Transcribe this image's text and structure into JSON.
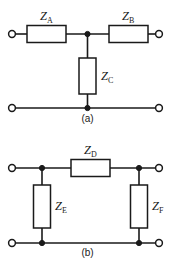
{
  "figure": {
    "background_color": "#ffffff",
    "line_color": "#1a1a1a"
  },
  "circuits": [
    {
      "id": "a",
      "caption": "(a)",
      "topology": "tee-network",
      "components": [
        {
          "id": "ZA",
          "symbol": "Z",
          "subscript": "A",
          "label": "Z_A",
          "orientation": "horizontal",
          "branch": "series-left"
        },
        {
          "id": "ZB",
          "symbol": "Z",
          "subscript": "B",
          "label": "Z_B",
          "orientation": "horizontal",
          "branch": "series-right"
        },
        {
          "id": "ZC",
          "symbol": "Z",
          "subscript": "C",
          "label": "Z_C",
          "orientation": "vertical",
          "branch": "shunt-middle"
        }
      ],
      "terminals": [
        {
          "id": "in-top",
          "position": "top-left"
        },
        {
          "id": "out-top",
          "position": "top-right"
        },
        {
          "id": "in-bottom",
          "position": "bottom-left"
        },
        {
          "id": "out-bottom",
          "position": "bottom-right"
        }
      ],
      "nodes": [
        {
          "id": "node-top-mid",
          "position": "top-center"
        },
        {
          "id": "node-bottom-mid",
          "position": "bottom-center"
        }
      ]
    },
    {
      "id": "b",
      "caption": "(b)",
      "topology": "pi-network",
      "components": [
        {
          "id": "ZD",
          "symbol": "Z",
          "subscript": "D",
          "label": "Z_D",
          "orientation": "horizontal",
          "branch": "series-top"
        },
        {
          "id": "ZE",
          "symbol": "Z",
          "subscript": "E",
          "label": "Z_E",
          "orientation": "vertical",
          "branch": "shunt-left"
        },
        {
          "id": "ZF",
          "symbol": "Z",
          "subscript": "F",
          "label": "Z_F",
          "orientation": "vertical",
          "branch": "shunt-right"
        }
      ],
      "terminals": [
        {
          "id": "in-top",
          "position": "top-left"
        },
        {
          "id": "out-top",
          "position": "top-right"
        },
        {
          "id": "in-bottom",
          "position": "bottom-left"
        },
        {
          "id": "out-bottom",
          "position": "bottom-right"
        }
      ],
      "nodes": [
        {
          "id": "node-top-left",
          "position": "top-left-junction"
        },
        {
          "id": "node-top-right",
          "position": "top-right-junction"
        },
        {
          "id": "node-bottom-left",
          "position": "bottom-left-junction"
        },
        {
          "id": "node-bottom-right",
          "position": "bottom-right-junction"
        }
      ]
    }
  ]
}
